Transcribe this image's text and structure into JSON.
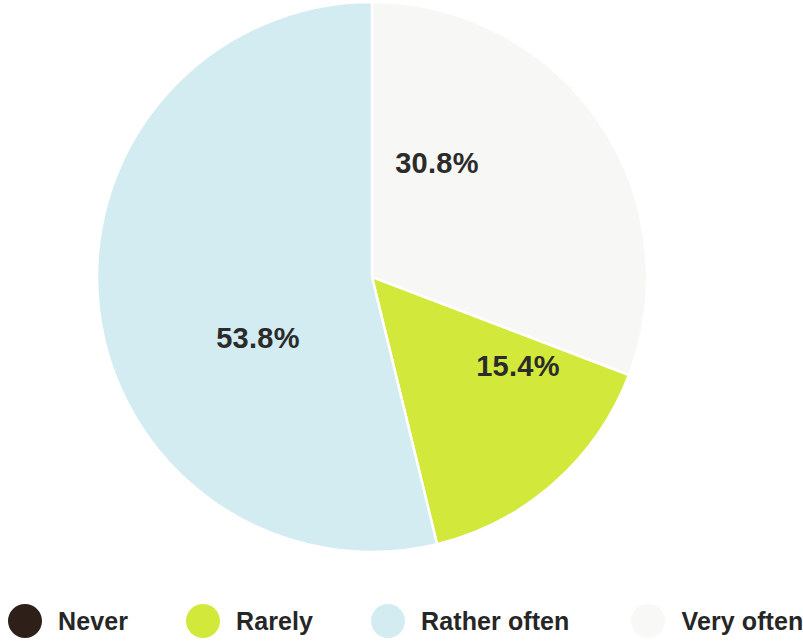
{
  "chart_data": {
    "type": "pie",
    "title": "",
    "subtitle": "",
    "xlabel": "",
    "ylabel": "",
    "grid": false,
    "legend_position": "bottom",
    "categories": [
      "Never",
      "Rarely",
      "Rather often",
      "Very often"
    ],
    "values": [
      0.0,
      15.4,
      53.8,
      30.8
    ],
    "value_labels": [
      "",
      "15.4%",
      "53.8%",
      "30.8%"
    ],
    "colors": [
      "#2e2018",
      "#d2e93c",
      "#d2ecf1",
      "#f7f7f5"
    ],
    "slices": [
      {
        "label": "Never",
        "value": 0.0,
        "display": "",
        "color": "#2e2018",
        "visible_in_pie": false,
        "start_angle": 0,
        "end_angle": 0,
        "label_x": 0,
        "label_y": 0
      },
      {
        "label": "Very often",
        "value": 30.8,
        "display": "30.8%",
        "color": "#f7f7f5",
        "visible_in_pie": true,
        "start_angle": 0,
        "end_angle": 110.88,
        "label_x": 437,
        "label_y": 165
      },
      {
        "label": "Rarely",
        "value": 15.4,
        "display": "15.4%",
        "color": "#d2e93c",
        "visible_in_pie": true,
        "start_angle": 110.88,
        "end_angle": 166.32,
        "label_x": 518,
        "label_y": 368
      },
      {
        "label": "Rather often",
        "value": 53.8,
        "display": "53.8%",
        "color": "#d2ecf1",
        "visible_in_pie": true,
        "start_angle": 166.32,
        "end_angle": 360,
        "label_x": 258,
        "label_y": 340
      }
    ],
    "geometry": {
      "center_x": 372,
      "center_y": 277,
      "radius": 275
    }
  },
  "legend": {
    "items": [
      {
        "label": "Never",
        "color": "#2e2018"
      },
      {
        "label": "Rarely",
        "color": "#d2e93c"
      },
      {
        "label": "Rather often",
        "color": "#d2ecf1"
      },
      {
        "label": "Very often",
        "color": "#f8f8f6"
      }
    ]
  }
}
